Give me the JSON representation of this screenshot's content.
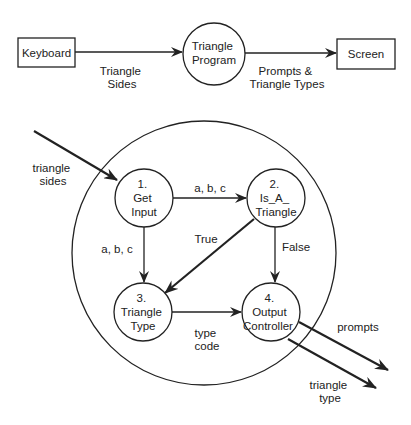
{
  "context_diagram": {
    "external_entities": [
      {
        "id": "keyboard",
        "label": "Keyboard"
      },
      {
        "id": "screen",
        "label": "Screen"
      }
    ],
    "process": {
      "id": "triangle-program",
      "lines": [
        "Triangle",
        "Program"
      ]
    },
    "flows": [
      {
        "id": "triangle-sides",
        "from": "keyboard",
        "to": "triangle-program",
        "lines": [
          "Triangle",
          "Sides"
        ]
      },
      {
        "id": "prompts-types",
        "from": "triangle-program",
        "to": "screen",
        "lines": [
          "Prompts &",
          "Triangle Types"
        ]
      }
    ]
  },
  "level1_diagram": {
    "processes": [
      {
        "id": "p1",
        "lines": [
          "1.",
          "Get",
          "Input"
        ]
      },
      {
        "id": "p2",
        "lines": [
          "2.",
          "Is_A_",
          "Triangle"
        ]
      },
      {
        "id": "p3",
        "lines": [
          "3.",
          "Triangle",
          "Type"
        ]
      },
      {
        "id": "p4",
        "lines": [
          "4.",
          "Output",
          "Controller"
        ]
      }
    ],
    "flows": [
      {
        "id": "in-sides",
        "from": "external",
        "to": "p1",
        "lines": [
          "triangle",
          "sides"
        ]
      },
      {
        "id": "f12",
        "from": "p1",
        "to": "p2",
        "lines": [
          "a, b, c"
        ]
      },
      {
        "id": "f13",
        "from": "p1",
        "to": "p3",
        "lines": [
          "a, b, c"
        ]
      },
      {
        "id": "f23",
        "from": "p2",
        "to": "p3",
        "lines": [
          "True"
        ]
      },
      {
        "id": "f24",
        "from": "p2",
        "to": "p4",
        "lines": [
          "False"
        ]
      },
      {
        "id": "f34",
        "from": "p3",
        "to": "p4",
        "lines": [
          "type",
          "code"
        ]
      },
      {
        "id": "out-prompts",
        "from": "p4",
        "to": "external",
        "lines": [
          "prompts"
        ]
      },
      {
        "id": "out-type",
        "from": "p4",
        "to": "external",
        "lines": [
          "triangle",
          "type"
        ]
      }
    ]
  }
}
